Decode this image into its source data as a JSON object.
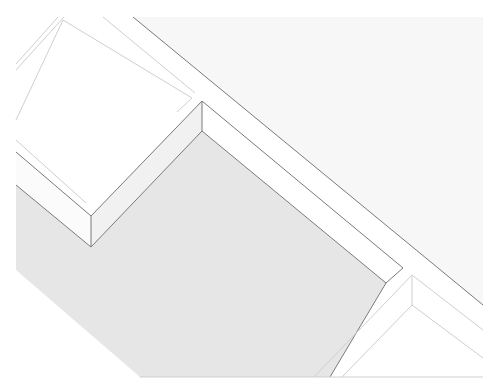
{
  "figure": {
    "description": "Isometric stepped architectural form with shaded lower plane",
    "colors": {
      "background": "#ffffff",
      "sky_panel": "#f7f7f7",
      "shaded_floor": "#e6e6e6",
      "step_face": "#ffffff",
      "riser_face": "#f1f1f1",
      "edge_dark": "#7a7a7a",
      "edge_light": "#cfcfcf"
    }
  }
}
